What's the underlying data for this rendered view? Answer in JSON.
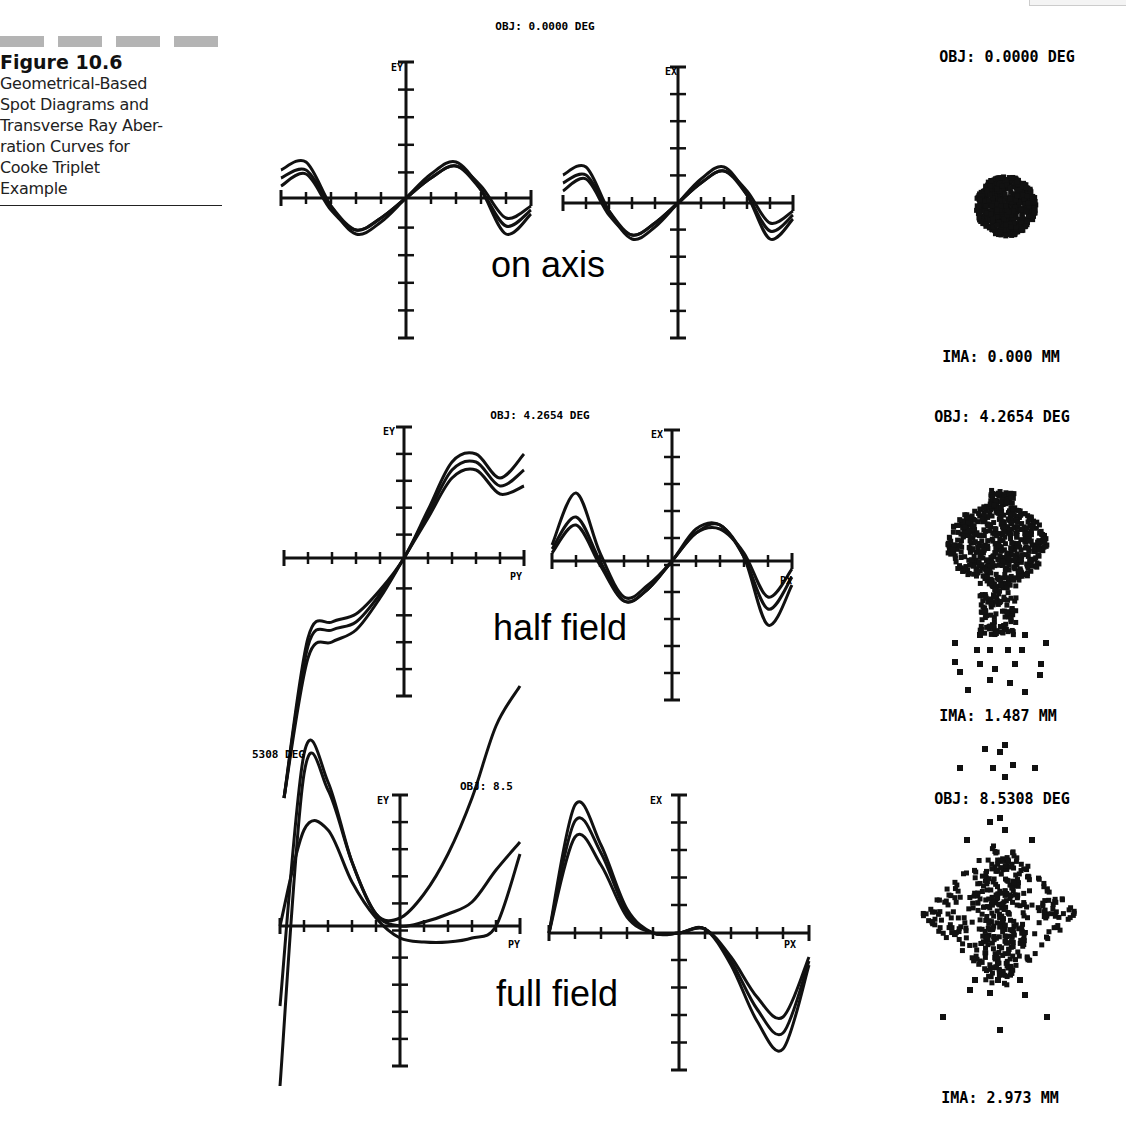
{
  "caption": {
    "figure_number": "Figure 10.6",
    "description": "Geometrical-Based Spot Diagrams and Transverse Ray Aberration Curves for Cooke Triplet Example",
    "lines": [
      "Geometrical-Based",
      "Spot Diagrams and",
      "Transverse Ray Aber-",
      "ration Curves for",
      "Cooke Triplet",
      "Example"
    ]
  },
  "rows": [
    {
      "label": "on axis",
      "fan_title": "OBJ: 0.0000 DEG",
      "tan_axis_label": "EY",
      "sag_axis_label": "EX",
      "tan_pupil_label": "PY",
      "sag_pupil_label": "PX",
      "spot_title": "OBJ: 0.0000 DEG",
      "spot_image_height": "IMA: 0.000 MM"
    },
    {
      "label": "half field",
      "fan_title": "OBJ: 4.2654 DEG",
      "tan_axis_label": "EY",
      "sag_axis_label": "EX",
      "tan_pupil_label": "PY",
      "sag_pupil_label": "PX",
      "spot_title": "OBJ: 4.2654 DEG",
      "spot_image_height": "IMA: 1.487 MM"
    },
    {
      "label": "full field",
      "fan_title": "OBJ: 8.5308 DEG",
      "fan_title_left_fragment": "5308 DEG",
      "fan_title_right_fragment": "OBJ: 8.5",
      "tan_axis_label": "EY",
      "sag_axis_label": "EX",
      "tan_pupil_label": "PY",
      "sag_pupil_label": "PX",
      "spot_title": "OBJ: 8.5308 DEG",
      "spot_image_height": "IMA: 2.973 MM"
    }
  ],
  "chart_data": [
    {
      "type": "line",
      "title": "OBJ: 0.0000 DEG (on axis) - tangential fan",
      "xlabel": "PY",
      "ylabel": "EY",
      "x": [
        -1,
        -0.8,
        -0.6,
        -0.4,
        -0.2,
        0,
        0.2,
        0.4,
        0.6,
        0.8,
        1
      ],
      "series": [
        {
          "name": "wavelength 1",
          "values": [
            0.7,
            0.9,
            -0.2,
            -0.9,
            -0.6,
            0,
            0.6,
            0.9,
            0.2,
            -0.9,
            -0.4
          ]
        },
        {
          "name": "wavelength 2",
          "values": [
            0.5,
            0.7,
            -0.2,
            -0.8,
            -0.5,
            0,
            0.5,
            0.8,
            0.2,
            -0.7,
            -0.3
          ]
        },
        {
          "name": "wavelength 3",
          "values": [
            0.3,
            0.6,
            -0.3,
            -0.8,
            -0.5,
            0,
            0.5,
            0.8,
            0.3,
            -0.5,
            -0.2
          ]
        }
      ],
      "xlim": [
        -1,
        1
      ],
      "ylim": [
        -5,
        5
      ]
    },
    {
      "type": "line",
      "title": "OBJ: 0.0000 DEG (on axis) - sagittal fan",
      "xlabel": "PX",
      "ylabel": "EX",
      "x": [
        -1,
        -0.8,
        -0.6,
        -0.4,
        -0.2,
        0,
        0.2,
        0.4,
        0.6,
        0.8,
        1
      ],
      "series": [
        {
          "name": "wavelength 1",
          "values": [
            0.7,
            0.9,
            -0.2,
            -0.9,
            -0.6,
            0,
            0.6,
            0.9,
            0.2,
            -0.9,
            -0.4
          ]
        },
        {
          "name": "wavelength 2",
          "values": [
            0.5,
            0.7,
            -0.2,
            -0.8,
            -0.5,
            0,
            0.5,
            0.8,
            0.2,
            -0.7,
            -0.3
          ]
        },
        {
          "name": "wavelength 3",
          "values": [
            0.3,
            0.6,
            -0.3,
            -0.8,
            -0.5,
            0,
            0.5,
            0.8,
            0.3,
            -0.5,
            -0.2
          ]
        }
      ],
      "xlim": [
        -1,
        1
      ],
      "ylim": [
        -5,
        5
      ]
    },
    {
      "type": "line",
      "title": "OBJ: 4.2654 DEG (half field) - tangential fan",
      "xlabel": "PY",
      "ylabel": "EY",
      "x": [
        -1,
        -0.8,
        -0.6,
        -0.4,
        -0.2,
        0,
        0.2,
        0.4,
        0.6,
        0.8,
        1
      ],
      "series": [
        {
          "name": "wavelength 1",
          "values": [
            -6.0,
            -2.0,
            -1.6,
            -1.4,
            -0.8,
            0,
            1.2,
            2.4,
            2.6,
            2.0,
            2.6
          ]
        },
        {
          "name": "wavelength 2",
          "values": [
            -6.0,
            -2.2,
            -1.8,
            -1.6,
            -0.9,
            0,
            1.1,
            2.2,
            2.4,
            1.8,
            2.2
          ]
        },
        {
          "name": "wavelength 3",
          "values": [
            -6.0,
            -2.5,
            -2.1,
            -1.8,
            -1.0,
            0,
            1.0,
            2.0,
            2.2,
            1.6,
            1.8
          ]
        }
      ],
      "xlim": [
        -1,
        1
      ],
      "ylim": [
        -5,
        5
      ]
    },
    {
      "type": "line",
      "title": "OBJ: 4.2654 DEG (half field) - sagittal fan",
      "xlabel": "PX",
      "ylabel": "EX",
      "x": [
        -1,
        -0.8,
        -0.6,
        -0.4,
        -0.2,
        0,
        0.2,
        0.4,
        0.6,
        0.8,
        1
      ],
      "series": [
        {
          "name": "wavelength 1",
          "values": [
            0.4,
            1.7,
            0.2,
            -0.9,
            -0.6,
            0,
            0.8,
            0.9,
            0.1,
            -1.6,
            -0.6
          ]
        },
        {
          "name": "wavelength 2",
          "values": [
            0.3,
            1.1,
            0.0,
            -1.0,
            -0.7,
            0,
            0.7,
            0.9,
            0.1,
            -1.2,
            -0.4
          ]
        },
        {
          "name": "wavelength 3",
          "values": [
            0.2,
            0.9,
            -0.1,
            -1.0,
            -0.7,
            0,
            0.7,
            0.8,
            0.2,
            -0.9,
            -0.2
          ]
        }
      ],
      "xlim": [
        -1,
        1
      ],
      "ylim": [
        -5,
        5
      ]
    },
    {
      "type": "line",
      "title": "OBJ: 8.5308 DEG (full field) - tangential fan",
      "xlabel": "PY",
      "ylabel": "EY",
      "x": [
        -1,
        -0.8,
        -0.6,
        -0.4,
        -0.2,
        0,
        0.2,
        0.4,
        0.6,
        0.8,
        1
      ],
      "series": [
        {
          "name": "wavelength 1",
          "values": [
            -4.0,
            3.8,
            3.4,
            1.6,
            0.3,
            0.2,
            0.8,
            1.8,
            3.2,
            5.0,
            6.0
          ]
        },
        {
          "name": "wavelength 2",
          "values": [
            -2.0,
            4.3,
            3.6,
            1.6,
            0.3,
            0.0,
            0.1,
            0.3,
            0.6,
            1.4,
            2.1
          ]
        },
        {
          "name": "wavelength 3",
          "values": [
            0.0,
            2.4,
            2.4,
            1.1,
            0.2,
            -0.3,
            -0.4,
            -0.4,
            -0.3,
            0.0,
            1.8
          ]
        }
      ],
      "xlim": [
        -1,
        1
      ],
      "ylim": [
        -5,
        5
      ]
    },
    {
      "type": "line",
      "title": "OBJ: 8.5308 DEG (full field) - sagittal fan",
      "xlabel": "PX",
      "ylabel": "EX",
      "x": [
        -1,
        -0.8,
        -0.6,
        -0.4,
        -0.2,
        0,
        0.2,
        0.4,
        0.6,
        0.8,
        1
      ],
      "series": [
        {
          "name": "wavelength 1",
          "values": [
            0.0,
            3.2,
            2.2,
            0.6,
            0.0,
            0.0,
            0.1,
            -0.8,
            -2.2,
            -2.9,
            -0.8
          ]
        },
        {
          "name": "wavelength 2",
          "values": [
            0.0,
            2.8,
            2.0,
            0.5,
            0.0,
            0.0,
            0.1,
            -0.7,
            -1.9,
            -2.5,
            -0.7
          ]
        },
        {
          "name": "wavelength 3",
          "values": [
            0.0,
            2.4,
            1.7,
            0.4,
            0.0,
            0.0,
            0.1,
            -0.6,
            -1.6,
            -2.1,
            -0.6
          ]
        }
      ],
      "xlim": [
        -1,
        1
      ],
      "ylim": [
        -5,
        5
      ]
    },
    {
      "type": "scatter",
      "title": "Spot diagrams",
      "spots": [
        {
          "field": "OBJ: 0.0000 DEG",
          "image_height": "IMA: 0.000 MM",
          "shape": "compact round spot"
        },
        {
          "field": "OBJ: 4.2654 DEG",
          "image_height": "IMA: 1.487 MM",
          "shape": "comatic flare, tail downward"
        },
        {
          "field": "OBJ: 8.5308 DEG",
          "image_height": "IMA: 2.973 MM",
          "shape": "broad diamond flare"
        }
      ]
    }
  ],
  "colors": {
    "ink": "#111111",
    "background": "#ffffff",
    "caption_bar": "#b4b4b4"
  }
}
